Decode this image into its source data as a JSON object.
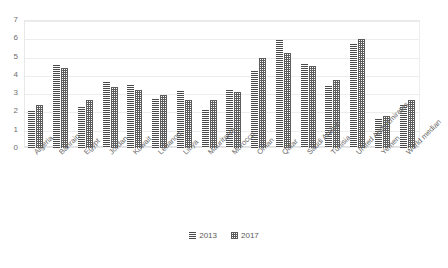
{
  "watermark": {
    "top_text": "",
    "right_text": "",
    "mid_text": ""
  },
  "legend": {
    "position": "bottom-center",
    "items": [
      {
        "label": "2013",
        "pattern": "horizontal-lines",
        "color": "#4a4a4a"
      },
      {
        "label": "2017",
        "pattern": "crosshatch-dots",
        "color": "#5c5c5c"
      }
    ]
  },
  "chart_data": {
    "type": "bar",
    "title": "",
    "subtitle": "",
    "xlabel": "",
    "ylabel": "",
    "ylim": [
      0,
      7
    ],
    "ytick_step": 1,
    "ytick_labels": [
      "0",
      "1",
      "2",
      "3",
      "4",
      "5",
      "6",
      "7"
    ],
    "grid": true,
    "legend_position": "bottom-center",
    "categories": [
      "Algeria",
      "Bahrain",
      "Egypt",
      "Jordan",
      "Kuwait",
      "Lebanon",
      "Libya",
      "Mauritania",
      "Morocco",
      "Oman",
      "Qatar",
      "Saudi Arabia",
      "Tunisia",
      "United Arab Emirates",
      "Yemen",
      "World median"
    ],
    "series": [
      {
        "name": "2013",
        "values": [
          2.0,
          4.55,
          2.25,
          3.6,
          3.45,
          2.7,
          3.1,
          2.1,
          3.2,
          4.2,
          5.9,
          4.6,
          3.4,
          5.7,
          1.6,
          2.35
        ]
      },
      {
        "name": "2017",
        "values": [
          2.35,
          4.4,
          2.6,
          3.35,
          3.2,
          2.9,
          2.6,
          2.6,
          3.05,
          4.9,
          5.2,
          4.5,
          3.7,
          5.95,
          1.75,
          2.6
        ]
      }
    ]
  }
}
